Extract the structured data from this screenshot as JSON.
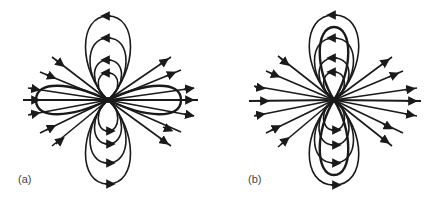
{
  "figure": {
    "stroke_color": "#1a1a1a",
    "background": "#ffffff",
    "panels": [
      {
        "id": "a",
        "label": "(a)",
        "description": "Field lines: nested vertical loops above and below a point source, radial lines, and a bold horizontal elongated loop",
        "center": [
          108,
          100
        ],
        "loop_tops": [
          16,
          38,
          60,
          73
        ],
        "loop_bottoms": [
          184,
          163,
          144,
          131
        ],
        "bold_loop": "horizontal"
      },
      {
        "id": "b",
        "label": "(b)",
        "description": "Field lines: nested vertical loops above and below a point source, radial lines, and a bold tall vertical loop",
        "center": [
          334,
          100
        ],
        "loop_tops": [
          15,
          38,
          58,
          72
        ],
        "loop_bottoms": [
          185,
          163,
          145,
          130
        ],
        "bold_loop": "vertical"
      }
    ]
  }
}
